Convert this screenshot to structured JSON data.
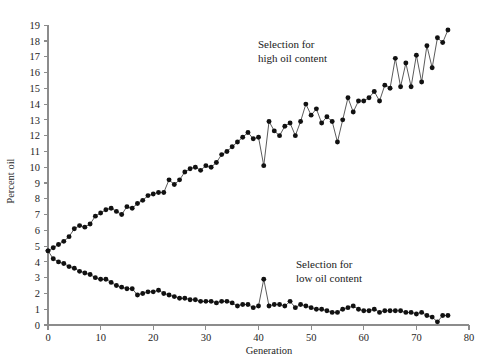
{
  "figure": {
    "caption": "Figure 1.1  Results of a long-term selection experiment.",
    "caption_visible": false
  },
  "chart_data": {
    "type": "line",
    "title": "",
    "xlabel": "Generation",
    "ylabel": "Percent oil",
    "xlim": [
      0,
      80
    ],
    "ylim": [
      0,
      19
    ],
    "xticks": [
      0,
      10,
      20,
      30,
      40,
      50,
      60,
      70,
      80
    ],
    "xtick_labels": [
      "0",
      "10",
      "20",
      "30",
      "40",
      "50",
      "60",
      "70",
      "80"
    ],
    "yticks": [
      0,
      1,
      2,
      3,
      4,
      5,
      6,
      7,
      8,
      9,
      10,
      11,
      12,
      13,
      14,
      15,
      16,
      17,
      18,
      19
    ],
    "ytick_labels": [
      "0",
      "1",
      "2",
      "3",
      "4",
      "5",
      "6",
      "7",
      "8",
      "9",
      "10",
      "11",
      "12",
      "13",
      "14",
      "15",
      "16",
      "17",
      "18",
      "19"
    ],
    "grid": false,
    "legend_position": "inline-annotations",
    "marker": "filled-circle",
    "line_color": "#5b5b5b",
    "marker_color": "#111111",
    "axis_color": "#8c8c8c",
    "annotations": [
      {
        "name": "high-oil-annotation",
        "lines": [
          "Selection for",
          "high oil content"
        ],
        "x_px": 258,
        "y_px": 48
      },
      {
        "name": "low-oil-annotation",
        "lines": [
          "Selection for",
          "low oil content"
        ],
        "x_px": 296,
        "y_px": 268
      }
    ],
    "series": [
      {
        "name": "Selection for high oil content",
        "x": [
          0,
          1,
          2,
          3,
          4,
          5,
          6,
          7,
          8,
          9,
          10,
          11,
          12,
          13,
          14,
          15,
          16,
          17,
          18,
          19,
          20,
          21,
          22,
          23,
          24,
          25,
          26,
          27,
          28,
          29,
          30,
          31,
          32,
          33,
          34,
          35,
          36,
          37,
          38,
          39,
          40,
          41,
          42,
          43,
          44,
          45,
          46,
          47,
          48,
          49,
          50,
          51,
          52,
          53,
          54,
          55,
          56,
          57,
          58,
          59,
          60,
          61,
          62,
          63,
          64,
          65,
          66,
          67,
          68,
          69,
          70,
          71,
          72,
          73,
          74,
          75,
          76
        ],
        "values": [
          4.7,
          4.9,
          5.1,
          5.3,
          5.6,
          6.1,
          6.3,
          6.2,
          6.4,
          6.9,
          7.1,
          7.3,
          7.4,
          7.2,
          7.0,
          7.5,
          7.4,
          7.7,
          7.9,
          8.2,
          8.3,
          8.4,
          8.4,
          9.2,
          8.9,
          9.2,
          9.7,
          9.9,
          10.0,
          9.8,
          10.1,
          10.0,
          10.3,
          10.8,
          11.0,
          11.3,
          11.6,
          11.9,
          12.2,
          11.8,
          11.9,
          10.1,
          12.9,
          12.3,
          12.0,
          12.6,
          12.8,
          12.0,
          12.9,
          14.0,
          13.3,
          13.7,
          12.8,
          13.2,
          12.9,
          11.6,
          13.0,
          14.4,
          13.5,
          14.2,
          14.2,
          14.4,
          14.8,
          14.2,
          15.2,
          15.0,
          16.9,
          15.1,
          16.6,
          15.1,
          17.1,
          15.4,
          17.7,
          16.3,
          18.2,
          17.9,
          18.7
        ]
      },
      {
        "name": "Selection for low oil content",
        "x": [
          0,
          1,
          2,
          3,
          4,
          5,
          6,
          7,
          8,
          9,
          10,
          11,
          12,
          13,
          14,
          15,
          16,
          17,
          18,
          19,
          20,
          21,
          22,
          23,
          24,
          25,
          26,
          27,
          28,
          29,
          30,
          31,
          32,
          33,
          34,
          35,
          36,
          37,
          38,
          39,
          40,
          41,
          42,
          43,
          44,
          45,
          46,
          47,
          48,
          49,
          50,
          51,
          52,
          53,
          54,
          55,
          56,
          57,
          58,
          59,
          60,
          61,
          62,
          63,
          64,
          65,
          66,
          67,
          68,
          69,
          70,
          71,
          72,
          73,
          74,
          75,
          76
        ],
        "values": [
          4.7,
          4.2,
          4.0,
          3.9,
          3.7,
          3.6,
          3.4,
          3.3,
          3.2,
          3.0,
          2.9,
          2.9,
          2.7,
          2.5,
          2.4,
          2.3,
          2.3,
          1.9,
          2.0,
          2.1,
          2.1,
          2.2,
          2.0,
          1.9,
          1.8,
          1.7,
          1.7,
          1.6,
          1.6,
          1.5,
          1.5,
          1.5,
          1.4,
          1.5,
          1.5,
          1.4,
          1.2,
          1.3,
          1.3,
          1.1,
          1.2,
          2.9,
          1.2,
          1.3,
          1.3,
          1.2,
          1.5,
          1.1,
          1.3,
          1.2,
          1.1,
          1.0,
          1.0,
          0.9,
          0.8,
          0.8,
          1.0,
          1.1,
          1.2,
          1.0,
          0.9,
          0.9,
          1.0,
          0.8,
          0.9,
          0.9,
          0.9,
          0.9,
          0.8,
          0.8,
          0.7,
          0.8,
          0.6,
          0.5,
          0.2,
          0.6,
          0.6
        ]
      }
    ]
  }
}
